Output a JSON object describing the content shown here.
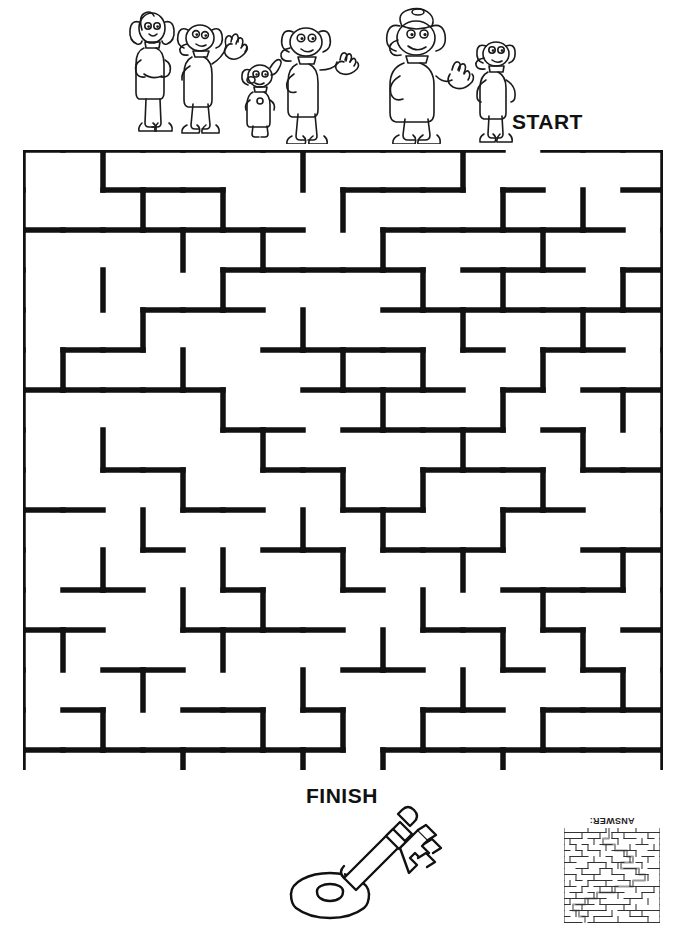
{
  "page": {
    "background_color": "#ffffff",
    "ink_color": "#111111",
    "width": 684,
    "height": 932
  },
  "labels": {
    "start": "START",
    "finish": "FINISH"
  },
  "answer_key": {
    "caption": "ANSWER:",
    "rotated_180": true
  },
  "illustrations": {
    "characters": {
      "name": "cartoon-dog-characters",
      "count": 6,
      "description": "line-art cartoon dogs standing in a group"
    },
    "prize": {
      "name": "skeleton-key",
      "description": "line-art skeleton key with round bow and toothed bit"
    }
  },
  "maze": {
    "type": "grid-maze",
    "cols": 16,
    "rows": 16,
    "cell": 40,
    "origin_x": 23,
    "origin_y": 150,
    "wall_thickness": 5,
    "entrance": {
      "side": "top",
      "label": "START",
      "cell_col": 12
    },
    "exit": {
      "side": "bottom",
      "label": "FINISH",
      "cell_col": 8
    },
    "border_gaps": {
      "top": [
        12
      ],
      "bottom": [
        8
      ]
    },
    "h_walls": [
      [
        0,
        1,
        2,
        3,
        4,
        5,
        6,
        7,
        8,
        9,
        10,
        11,
        13,
        14,
        15
      ],
      [
        2,
        3,
        4,
        8,
        9,
        10,
        12,
        15
      ],
      [
        0,
        1,
        2,
        3,
        4,
        5,
        6,
        9,
        10,
        11,
        12,
        13,
        14
      ],
      [
        5,
        6,
        7,
        8,
        9,
        11,
        12,
        13,
        15
      ],
      [
        3,
        4,
        5,
        9,
        10,
        11,
        12,
        13,
        14,
        15
      ],
      [
        1,
        2,
        6,
        7,
        8,
        9,
        11,
        13,
        14
      ],
      [
        0,
        1,
        2,
        3,
        4,
        7,
        8,
        9,
        10,
        12,
        14,
        15
      ],
      [
        5,
        6,
        8,
        9,
        10,
        11,
        13
      ],
      [
        2,
        3,
        6,
        7,
        10,
        11,
        12,
        14,
        15
      ],
      [
        0,
        1,
        4,
        5,
        8,
        9,
        12,
        13
      ],
      [
        3,
        6,
        7,
        9,
        10,
        11,
        14,
        15
      ],
      [
        1,
        2,
        5,
        8,
        12,
        13,
        14
      ],
      [
        0,
        1,
        4,
        5,
        6,
        7,
        10,
        11,
        13,
        15
      ],
      [
        2,
        3,
        8,
        9,
        12,
        14
      ],
      [
        1,
        4,
        5,
        7,
        10,
        11,
        13,
        14,
        15
      ],
      [
        0,
        1,
        2,
        3,
        4,
        5,
        6,
        7,
        9,
        10,
        11,
        12,
        13,
        14,
        15
      ]
    ],
    "v_walls": [
      [
        0,
        2,
        7,
        11,
        16
      ],
      [
        0,
        3,
        5,
        8,
        12,
        14,
        16
      ],
      [
        0,
        4,
        6,
        9,
        13,
        16
      ],
      [
        0,
        2,
        5,
        10,
        12,
        15,
        16
      ],
      [
        0,
        3,
        7,
        11,
        14,
        16
      ],
      [
        0,
        1,
        4,
        8,
        10,
        13,
        16
      ],
      [
        0,
        5,
        9,
        12,
        15,
        16
      ],
      [
        0,
        2,
        6,
        11,
        14,
        16
      ],
      [
        0,
        4,
        8,
        10,
        13,
        16
      ],
      [
        0,
        3,
        7,
        9,
        12,
        16
      ],
      [
        0,
        2,
        5,
        8,
        11,
        15,
        16
      ],
      [
        0,
        4,
        6,
        10,
        13,
        16
      ],
      [
        0,
        1,
        5,
        9,
        12,
        14,
        16
      ],
      [
        0,
        3,
        7,
        11,
        15,
        16
      ],
      [
        0,
        2,
        6,
        8,
        10,
        13,
        16
      ],
      [
        0,
        4,
        7,
        9,
        12,
        16
      ]
    ]
  }
}
